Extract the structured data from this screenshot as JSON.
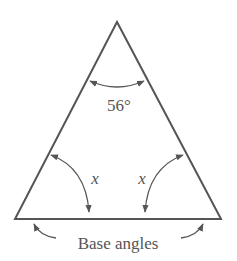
{
  "diagram": {
    "type": "isosceles-triangle",
    "apex_angle_label": "56°",
    "left_base_angle_label": "x",
    "right_base_angle_label": "x",
    "base_caption": "Base angles",
    "colors": {
      "line": "#555555",
      "text": "#555555",
      "background": "#ffffff"
    }
  }
}
